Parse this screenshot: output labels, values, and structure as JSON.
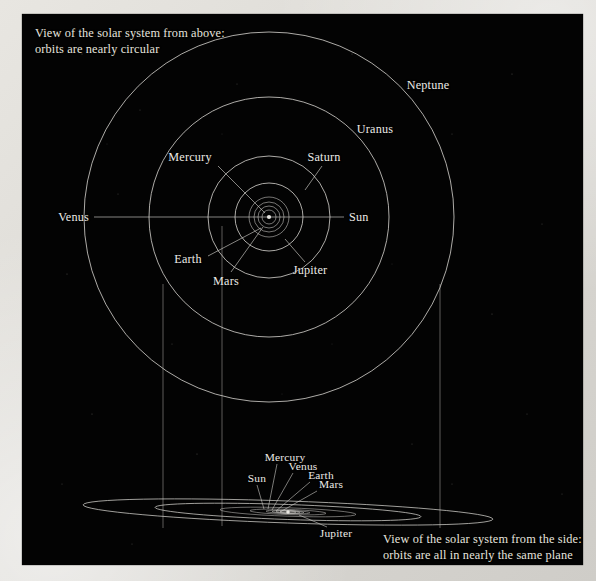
{
  "figure": {
    "kind": "solar-system-orbit-diagram",
    "background_color": "#030303",
    "ink_color": "#d8d6d1",
    "page_color": "#ddd bd6"
  },
  "captions": {
    "top": "View of the solar system from above:\norbits are nearly circular",
    "bottom": "View of the solar system from the side:\norbits are all in nearly the same plane"
  },
  "top_view": {
    "center": {
      "x": 247,
      "y": 203
    },
    "orbits": [
      {
        "name": "Mercury",
        "radius": 7
      },
      {
        "name": "Venus",
        "radius": 11
      },
      {
        "name": "Earth",
        "radius": 15
      },
      {
        "name": "Mars",
        "radius": 20
      },
      {
        "name": "Jupiter",
        "radius": 34
      },
      {
        "name": "Saturn",
        "radius": 61
      },
      {
        "name": "Uranus",
        "radius": 120
      },
      {
        "name": "Neptune",
        "radius": 185
      }
    ],
    "axis_line": {
      "x1": 72,
      "x2": 322,
      "y": 203
    },
    "labels": [
      {
        "name": "Mercury",
        "text": "Mercury",
        "x": 168,
        "y": 143,
        "align": "mid",
        "leader": {
          "x1": 196,
          "y1": 152,
          "x2": 243,
          "y2": 199
        }
      },
      {
        "name": "Saturn",
        "text": "Saturn",
        "x": 302,
        "y": 143,
        "align": "mid",
        "leader": {
          "x1": 300,
          "y1": 152,
          "x2": 283,
          "y2": 176
        }
      },
      {
        "name": "Venus",
        "text": "Venus",
        "x": 67,
        "y": 203,
        "align": "left",
        "leader": null
      },
      {
        "name": "Sun",
        "text": "Sun",
        "x": 327,
        "y": 203,
        "align": "right",
        "leader": null
      },
      {
        "name": "Earth",
        "text": "Earth",
        "x": 166,
        "y": 245,
        "align": "mid",
        "leader": {
          "x1": 186,
          "y1": 242,
          "x2": 239,
          "y2": 214
        }
      },
      {
        "name": "Mars",
        "text": "Mars",
        "x": 204,
        "y": 267,
        "align": "mid",
        "leader": {
          "x1": 209,
          "y1": 258,
          "x2": 241,
          "y2": 213
        }
      },
      {
        "name": "Jupiter",
        "text": "Jupiter",
        "x": 288,
        "y": 256,
        "align": "mid",
        "leader": {
          "x1": 283,
          "y1": 248,
          "x2": 263,
          "y2": 225
        }
      },
      {
        "name": "Uranus",
        "text": "Uranus",
        "x": 353,
        "y": 115,
        "align": "mid",
        "leader": null
      },
      {
        "name": "Neptune",
        "text": "Neptune",
        "x": 406,
        "y": 71,
        "align": "mid",
        "leader": null
      }
    ]
  },
  "projection_lines": [
    {
      "name": "drop-line-left",
      "x": 141,
      "y1": 270,
      "y2": 514
    },
    {
      "name": "drop-line-middle",
      "x": 200,
      "y1": 212,
      "y2": 512
    },
    {
      "name": "drop-line-right",
      "x": 418,
      "y1": 270,
      "y2": 514
    }
  ],
  "side_view": {
    "center": {
      "x": 266,
      "y": 498
    },
    "tilt_deg": 2.0,
    "ellipses": [
      {
        "name": "Neptune",
        "rx": 205,
        "ry": 11
      },
      {
        "name": "Uranus",
        "rx": 133,
        "ry": 7.5
      },
      {
        "name": "Saturn",
        "rx": 68,
        "ry": 4.2
      },
      {
        "name": "Jupiter",
        "rx": 38,
        "ry": 2.6
      },
      {
        "name": "Mars",
        "rx": 22,
        "ry": 1.7
      },
      {
        "name": "Earth",
        "rx": 16,
        "ry": 1.3
      },
      {
        "name": "Venus",
        "rx": 12,
        "ry": 1.1
      },
      {
        "name": "Mercury",
        "rx": 8,
        "ry": 0.9
      }
    ],
    "converge_point": {
      "x": 266,
      "y": 498
    },
    "labels": [
      {
        "name": "Sun",
        "text": "Sun",
        "x": 235,
        "y": 464,
        "align": "mid",
        "leader": {
          "x1": 235,
          "y1": 471,
          "x2": 242,
          "y2": 495
        }
      },
      {
        "name": "Mercury",
        "text": "Mercury",
        "x": 263,
        "y": 443,
        "align": "mid",
        "leader": {
          "x1": 255,
          "y1": 450,
          "x2": 246,
          "y2": 495
        }
      },
      {
        "name": "Venus",
        "text": "Venus",
        "x": 281,
        "y": 452,
        "align": "mid",
        "leader": {
          "x1": 271,
          "y1": 459,
          "x2": 250,
          "y2": 496
        }
      },
      {
        "name": "Earth",
        "text": "Earth",
        "x": 299,
        "y": 461,
        "align": "mid",
        "leader": {
          "x1": 288,
          "y1": 468,
          "x2": 254,
          "y2": 497
        }
      },
      {
        "name": "Mars",
        "text": "Mars",
        "x": 309,
        "y": 470,
        "align": "mid",
        "leader": {
          "x1": 295,
          "y1": 477,
          "x2": 258,
          "y2": 498
        }
      },
      {
        "name": "Jupiter",
        "text": "Jupiter",
        "x": 314,
        "y": 519,
        "align": "mid",
        "leader": {
          "x1": 305,
          "y1": 513,
          "x2": 277,
          "y2": 501
        }
      }
    ]
  },
  "stars": [
    {
      "x": 60,
      "y": 40,
      "r": 0.6
    },
    {
      "x": 118,
      "y": 96,
      "r": 0.5
    },
    {
      "x": 96,
      "y": 180,
      "r": 0.5
    },
    {
      "x": 45,
      "y": 260,
      "r": 0.6
    },
    {
      "x": 150,
      "y": 330,
      "r": 0.5
    },
    {
      "x": 70,
      "y": 400,
      "r": 0.6
    },
    {
      "x": 40,
      "y": 470,
      "r": 0.5
    },
    {
      "x": 215,
      "y": 70,
      "r": 0.5
    },
    {
      "x": 330,
      "y": 40,
      "r": 0.6
    },
    {
      "x": 430,
      "y": 120,
      "r": 0.5
    },
    {
      "x": 490,
      "y": 60,
      "r": 0.6
    },
    {
      "x": 520,
      "y": 210,
      "r": 0.5
    },
    {
      "x": 470,
      "y": 300,
      "r": 0.6
    },
    {
      "x": 505,
      "y": 400,
      "r": 0.5
    },
    {
      "x": 390,
      "y": 430,
      "r": 0.5
    },
    {
      "x": 175,
      "y": 440,
      "r": 0.6
    },
    {
      "x": 110,
      "y": 530,
      "r": 0.5
    },
    {
      "x": 430,
      "y": 470,
      "r": 0.5
    },
    {
      "x": 260,
      "y": 380,
      "r": 0.4
    },
    {
      "x": 310,
      "y": 330,
      "r": 0.4
    },
    {
      "x": 200,
      "y": 120,
      "r": 0.4
    },
    {
      "x": 370,
      "y": 250,
      "r": 0.4
    },
    {
      "x": 540,
      "y": 480,
      "r": 0.5
    },
    {
      "x": 85,
      "y": 130,
      "r": 0.4
    }
  ]
}
